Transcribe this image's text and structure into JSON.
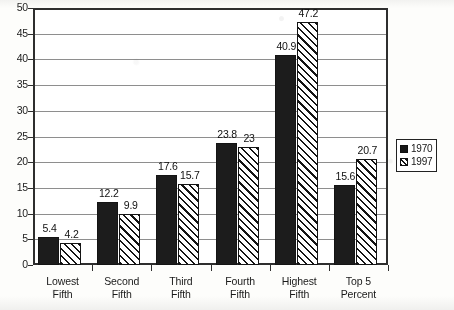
{
  "chart_data": {
    "type": "bar",
    "title": "",
    "xlabel": "",
    "ylabel": "",
    "ylim": [
      0,
      50
    ],
    "ytick_step": 5,
    "yticks": [
      "50",
      "45",
      "40",
      "35",
      "30",
      "25",
      "20",
      "15",
      "10",
      "5",
      "0"
    ],
    "grid": true,
    "legend_position": "right",
    "categories": [
      "Lowest Fifth",
      "Second Fifth",
      "Third Fifth",
      "Fourth Fifth",
      "Highest Fifth",
      "Top 5 Percent"
    ],
    "category_lines": [
      [
        "Lowest",
        "Fifth"
      ],
      [
        "Second",
        "Fifth"
      ],
      [
        "Third",
        "Fifth"
      ],
      [
        "Fourth",
        "Fifth"
      ],
      [
        "Highest",
        "Fifth"
      ],
      [
        "Top 5",
        "Percent"
      ]
    ],
    "series": [
      {
        "name": "1970",
        "fill": "solid-black",
        "color": "#1c1c1c",
        "values": [
          5.4,
          12.2,
          17.6,
          23.8,
          40.9,
          15.6
        ],
        "labels": [
          "5.4",
          "12.2",
          "17.6",
          "23.8",
          "40.9",
          "15.6"
        ]
      },
      {
        "name": "1997",
        "fill": "diagonal-hatch",
        "color": "#ffffff",
        "values": [
          4.2,
          9.9,
          15.7,
          23,
          47.2,
          20.7
        ],
        "labels": [
          "4.2",
          "9.9",
          "15.7",
          "23",
          "47.2",
          "20.7"
        ]
      }
    ]
  },
  "legend": {
    "items": [
      {
        "label": "1970",
        "swatch": "solid-black-swatch"
      },
      {
        "label": "1997",
        "swatch": "hatched-swatch"
      }
    ]
  },
  "colors": {
    "series_1970": "#1c1c1c",
    "series_1997_outline": "#141414",
    "axis": "#2e2e2e",
    "gridline": "#8e8e8e",
    "text": "#1a1a1a",
    "background": "#fdfdfb"
  }
}
